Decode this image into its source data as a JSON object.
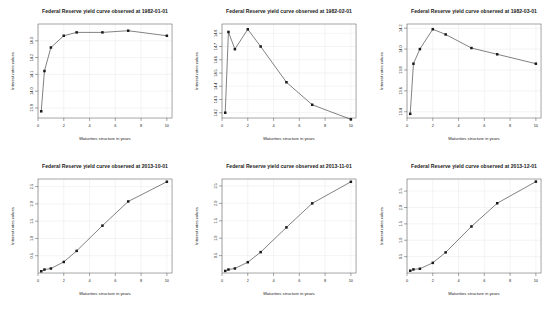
{
  "figure": {
    "layout": "2 rows x 3 columns",
    "background": "#ffffff",
    "line_color": "#1a1a1a",
    "grid_color": "#e2e2e2",
    "axis_color": "#4d4d4d"
  },
  "chart_data": [
    {
      "type": "line",
      "title": "Federal Reserve yield curve observed at 1982-01-01",
      "xlabel": "Maturities structure in years",
      "ylabel": "Interest rates values",
      "x": [
        0.25,
        0.5,
        1,
        2,
        3,
        5,
        7,
        10
      ],
      "values": [
        13.88,
        14.12,
        14.26,
        14.33,
        14.35,
        14.35,
        14.36,
        14.33
      ],
      "xlim": [
        0,
        10.4
      ],
      "ylim": [
        13.84,
        14.4
      ],
      "xticks": [
        0,
        2,
        4,
        6,
        8,
        10
      ],
      "yticks": [
        13.9,
        14.0,
        14.1,
        14.2,
        14.3
      ],
      "ytick_labels": [
        "13.9",
        "14.0",
        "14.1",
        "14.2",
        "14.3"
      ],
      "grid": true,
      "legend": "none"
    },
    {
      "type": "line",
      "title": "Federal Reserve yield curve observed at 1982-02-01",
      "xlabel": "Maturities structure in years",
      "ylabel": "Interest rates values",
      "x": [
        0.25,
        0.5,
        1,
        2,
        3,
        5,
        7,
        10
      ],
      "values": [
        14.2,
        14.81,
        14.68,
        14.83,
        14.7,
        14.43,
        14.26,
        14.15
      ],
      "xlim": [
        0,
        10.4
      ],
      "ylim": [
        14.16,
        14.87
      ],
      "xticks": [
        0,
        2,
        4,
        6,
        8,
        10
      ],
      "yticks": [
        14.2,
        14.3,
        14.4,
        14.5,
        14.6,
        14.7,
        14.8
      ],
      "ytick_labels": [
        "14.2",
        "14.3",
        "14.4",
        "14.5",
        "14.6",
        "14.7",
        "14.8"
      ],
      "grid": true,
      "legend": "none"
    },
    {
      "type": "line",
      "title": "Federal Reserve yield curve observed at 1982-03-01",
      "xlabel": "Maturities structure in years",
      "ylabel": "Interest rates values",
      "x": [
        0.25,
        0.5,
        1,
        2,
        3,
        5,
        7,
        10
      ],
      "values": [
        13.38,
        13.86,
        14.0,
        14.19,
        14.14,
        14.01,
        13.95,
        13.86
      ],
      "xlim": [
        0,
        10.4
      ],
      "ylim": [
        13.34,
        14.24
      ],
      "xticks": [
        0,
        2,
        4,
        6,
        8,
        10
      ],
      "yticks": [
        13.4,
        13.6,
        13.8,
        14.0,
        14.2
      ],
      "ytick_labels": [
        "13.4",
        "13.6",
        "13.8",
        "14.0",
        "14.2"
      ],
      "grid": true,
      "legend": "none"
    },
    {
      "type": "line",
      "title": "Federal Reserve yield curve observed at 2013-10-01",
      "xlabel": "Maturities structure in years",
      "ylabel": "Interest rates values",
      "x": [
        0.25,
        0.5,
        1,
        2,
        3,
        5,
        7,
        10
      ],
      "values": [
        0.05,
        0.1,
        0.13,
        0.32,
        0.64,
        1.37,
        2.07,
        2.64
      ],
      "xlim": [
        0,
        10.4
      ],
      "ylim": [
        0.0,
        2.72
      ],
      "xticks": [
        0,
        2,
        4,
        6,
        8,
        10
      ],
      "yticks": [
        0.5,
        1.0,
        1.5,
        2.0,
        2.5
      ],
      "ytick_labels": [
        "0.5",
        "1.0",
        "1.5",
        "2.0",
        "2.5"
      ],
      "grid": true,
      "legend": "none"
    },
    {
      "type": "line",
      "title": "Federal Reserve yield curve observed at 2013-11-01",
      "xlabel": "Maturities structure in years",
      "ylabel": "Interest rates values",
      "x": [
        0.25,
        0.5,
        1,
        2,
        3,
        5,
        7,
        10
      ],
      "values": [
        0.06,
        0.1,
        0.13,
        0.31,
        0.6,
        1.31,
        2.0,
        2.62
      ],
      "xlim": [
        0,
        10.4
      ],
      "ylim": [
        0.0,
        2.7
      ],
      "xticks": [
        0,
        2,
        4,
        6,
        8,
        10
      ],
      "yticks": [
        0.5,
        1.0,
        1.5,
        2.0,
        2.5
      ],
      "ytick_labels": [
        "0.5",
        "1.0",
        "1.5",
        "2.0",
        "2.5"
      ],
      "grid": true,
      "legend": "none"
    },
    {
      "type": "line",
      "title": "Federal Reserve yield curve observed at 2013-12-01",
      "xlabel": "Maturities structure in years",
      "ylabel": "Interest rates values",
      "x": [
        0.25,
        0.5,
        1,
        2,
        3,
        5,
        7,
        10
      ],
      "values": [
        0.07,
        0.11,
        0.13,
        0.31,
        0.63,
        1.42,
        2.13,
        2.79
      ],
      "xlim": [
        0,
        10.4
      ],
      "ylim": [
        0.0,
        2.87
      ],
      "xticks": [
        0,
        2,
        4,
        6,
        8,
        10
      ],
      "yticks": [
        0.5,
        1.0,
        1.5,
        2.0,
        2.5
      ],
      "ytick_labels": [
        "0.5",
        "1.0",
        "1.5",
        "2.0",
        "2.5"
      ],
      "grid": true,
      "legend": "none"
    }
  ]
}
